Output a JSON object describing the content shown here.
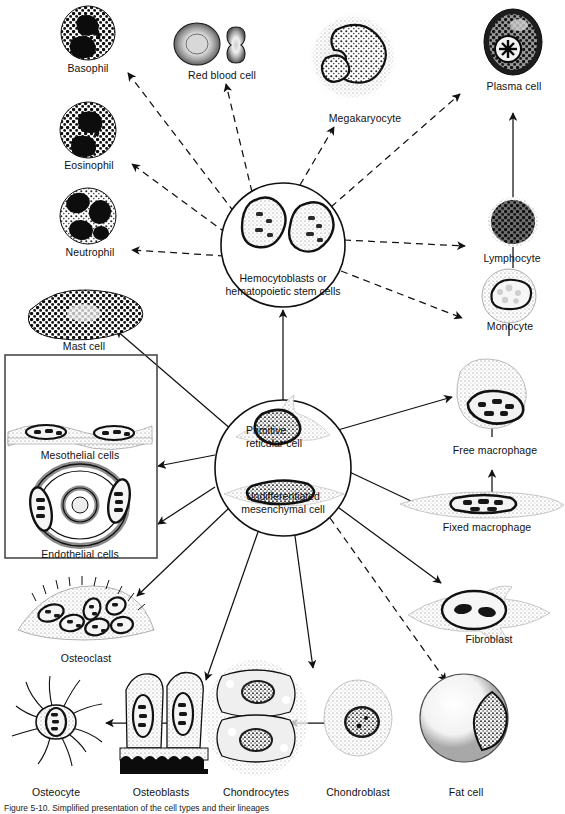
{
  "figure": {
    "type": "biology-diagram",
    "caption": "Figure  5-10.  Simplified  presentation  of  the  cell  types  and  their  lineages",
    "background_color": "#ffffff",
    "ink_color": "#111111"
  },
  "hubs": [
    {
      "id": "hemocytoblast",
      "label_line1": "Hemocytoblasts or",
      "label_line2": "hematopoietic stem cells",
      "cx": 283,
      "cy": 245,
      "r": 62
    },
    {
      "id": "mesenchyme",
      "label_line1": "Primitive",
      "label_line2": "reticular cell",
      "label_line3": "Undifferentiated",
      "label_line4": "mesenchymal cell",
      "cx": 283,
      "cy": 468,
      "r": 68
    }
  ],
  "cells": [
    {
      "id": "basophil",
      "label": "Basophil",
      "x": 88,
      "y": 62,
      "art": "granulocyte-basophil"
    },
    {
      "id": "red-blood-cell",
      "label": "Red blood cell",
      "x": 222,
      "y": 69,
      "art": "erythrocyte"
    },
    {
      "id": "megakaryocyte",
      "label": "Megakaryocyte",
      "x": 365,
      "y": 118,
      "art": "megakaryocyte"
    },
    {
      "id": "plasma-cell",
      "label": "Plasma cell",
      "x": 513,
      "y": 85,
      "art": "plasma-cell"
    },
    {
      "id": "eosinophil",
      "label": "Eosinophil",
      "x": 88,
      "y": 159,
      "art": "granulocyte-eosinophil"
    },
    {
      "id": "lymphocyte",
      "label": "Lymphocyte",
      "x": 510,
      "y": 250,
      "art": "lymphocyte"
    },
    {
      "id": "neutrophil",
      "label": "Neutrophil",
      "x": 88,
      "y": 246,
      "art": "granulocyte-neutrophil"
    },
    {
      "id": "monocyte",
      "label": "Monocyte",
      "x": 508,
      "y": 319,
      "art": "monocyte"
    },
    {
      "id": "mast-cell",
      "label": "Mast cell",
      "x": 82,
      "y": 344,
      "art": "mast-cell"
    },
    {
      "id": "mesothelial",
      "label": "Mesothelial cells",
      "x": 80,
      "y": 448,
      "art": "mesothelial-sheet"
    },
    {
      "id": "free-macrophage",
      "label": "Free macrophage",
      "x": 493,
      "y": 449,
      "art": "free-macrophage"
    },
    {
      "id": "endothelial",
      "label": "Endothelial cells",
      "x": 80,
      "y": 548,
      "art": "endothelial-vessel"
    },
    {
      "id": "fixed-macrophage",
      "label": "Fixed macrophage",
      "x": 487,
      "y": 525,
      "art": "fixed-macrophage"
    },
    {
      "id": "osteoclast",
      "label": "Osteoclast",
      "x": 84,
      "y": 652,
      "art": "osteoclast"
    },
    {
      "id": "fibroblast",
      "label": "Fibroblast",
      "x": 489,
      "y": 635,
      "art": "fibroblast"
    },
    {
      "id": "osteocyte",
      "label": "Osteocyte",
      "x": 55,
      "y": 791,
      "art": "osteocyte"
    },
    {
      "id": "osteoblasts",
      "label": "Osteoblasts",
      "x": 160,
      "y": 791,
      "art": "osteoblasts"
    },
    {
      "id": "chondrocytes",
      "label": "Chondrocytes",
      "x": 256,
      "y": 791,
      "art": "chondrocytes"
    },
    {
      "id": "chondroblast",
      "label": "Chondroblast",
      "x": 358,
      "y": 791,
      "art": "chondroblast"
    },
    {
      "id": "fat-cell",
      "label": "Fat cell",
      "x": 464,
      "y": 791,
      "art": "fat-cell"
    }
  ],
  "boxes": [
    {
      "id": "serosal-box",
      "x": 5,
      "y": 355,
      "w": 152,
      "h": 203,
      "contains": [
        "mesothelial",
        "endothelial"
      ]
    }
  ],
  "arrow_styles": {
    "dashed": "differentiation from hemocytoblast (blood lineage)",
    "solid": "differentiation from mesenchymal cell / direct maturation step"
  },
  "edges": [
    {
      "from": "hemocytoblast",
      "to": "basophil",
      "style": "dashed"
    },
    {
      "from": "hemocytoblast",
      "to": "eosinophil",
      "style": "dashed"
    },
    {
      "from": "hemocytoblast",
      "to": "neutrophil",
      "style": "dashed"
    },
    {
      "from": "hemocytoblast",
      "to": "red-blood-cell",
      "style": "dashed"
    },
    {
      "from": "hemocytoblast",
      "to": "megakaryocyte",
      "style": "dashed"
    },
    {
      "from": "hemocytoblast",
      "to": "plasma-cell",
      "style": "dashed"
    },
    {
      "from": "hemocytoblast",
      "to": "lymphocyte",
      "style": "dashed"
    },
    {
      "from": "hemocytoblast",
      "to": "monocyte",
      "style": "dashed"
    },
    {
      "from": "lymphocyte",
      "to": "plasma-cell",
      "style": "solid"
    },
    {
      "from": "lymphocyte",
      "to": "monocyte",
      "style": "solid"
    },
    {
      "from": "monocyte",
      "to": "free-macrophage",
      "style": "solid"
    },
    {
      "from": "fixed-macrophage",
      "to": "free-macrophage",
      "style": "solid"
    },
    {
      "from": "mesenchyme",
      "to": "hemocytoblast",
      "style": "solid"
    },
    {
      "from": "mesenchyme",
      "to": "mast-cell",
      "style": "solid"
    },
    {
      "from": "mesenchyme",
      "to": "mesothelial",
      "style": "solid"
    },
    {
      "from": "mesenchyme",
      "to": "endothelial",
      "style": "solid"
    },
    {
      "from": "mesenchyme",
      "to": "osteoclast",
      "style": "solid"
    },
    {
      "from": "mesenchyme",
      "to": "free-macrophage",
      "style": "solid"
    },
    {
      "from": "mesenchyme",
      "to": "fixed-macrophage",
      "style": "solid"
    },
    {
      "from": "mesenchyme",
      "to": "fibroblast",
      "style": "solid"
    },
    {
      "from": "mesenchyme",
      "to": "osteoblasts",
      "style": "solid"
    },
    {
      "from": "mesenchyme",
      "to": "chondroblast",
      "style": "solid"
    },
    {
      "from": "mesenchyme",
      "to": "fat-cell",
      "style": "dashed"
    },
    {
      "from": "osteoblasts",
      "to": "osteocyte",
      "style": "solid"
    },
    {
      "from": "chondroblast",
      "to": "chondrocytes",
      "style": "solid"
    }
  ]
}
